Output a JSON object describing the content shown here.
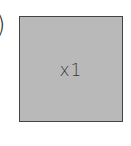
{
  "left_fragment": {
    "glyph": ")"
  },
  "tile": {
    "label": "x1",
    "fill_color": "#b9b9b9",
    "border_color": "#444444"
  }
}
